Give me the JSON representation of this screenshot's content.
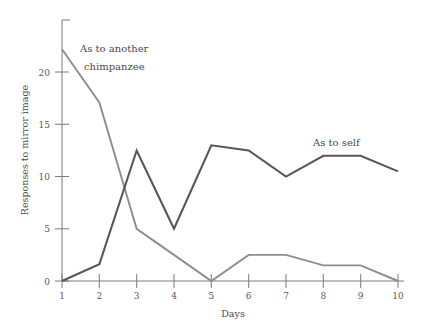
{
  "chart_data": {
    "type": "line",
    "title": "",
    "xlabel": "Days",
    "ylabel": "Responses to mirror image",
    "x": [
      1,
      2,
      3,
      4,
      5,
      6,
      7,
      8,
      9,
      10
    ],
    "xticklabels": [
      "1",
      "2",
      "3",
      "4",
      "5",
      "6",
      "7",
      "8",
      "9",
      "10"
    ],
    "yticklabels": [
      "0",
      "5",
      "10",
      "15",
      "20"
    ],
    "yticks": [
      0,
      5,
      10,
      15,
      20
    ],
    "xlim": [
      1,
      10
    ],
    "ylim": [
      0,
      23.5
    ],
    "grid": false,
    "legend_position": "inline-annotations",
    "series": [
      {
        "name": "As to another chimpanzee",
        "color": "#8d8d8d",
        "values": [
          22.2,
          17.1,
          5.0,
          2.5,
          0.0,
          2.5,
          2.5,
          1.5,
          1.5,
          0.0
        ],
        "annotation": "As to another\nchimpanzee",
        "annotation_line1": "As to another",
        "annotation_line2": "chimpanzee"
      },
      {
        "name": "As to self",
        "color": "#575757",
        "values": [
          0.0,
          1.6,
          12.5,
          5.0,
          13.0,
          12.5,
          10.0,
          12.0,
          12.0,
          10.5
        ],
        "annotation": "As to self",
        "annotation_line1": "As to self",
        "annotation_line2": ""
      }
    ]
  },
  "axes": {
    "x_axis_title": "Days",
    "y_axis_title": "Responses to mirror image"
  }
}
